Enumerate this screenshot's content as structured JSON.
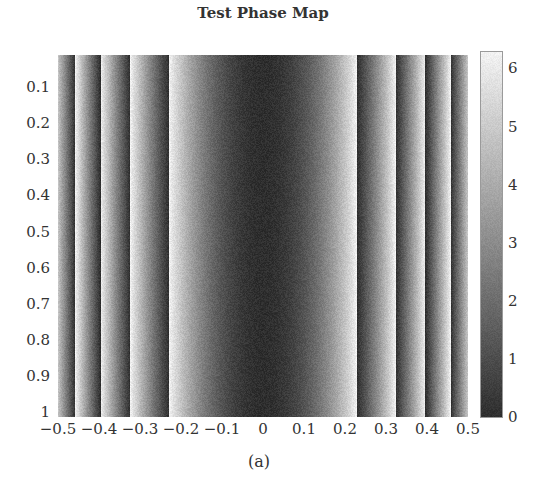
{
  "chart_data": {
    "type": "heatmap",
    "title": "Test Phase Map",
    "caption": "(a)",
    "xlabel": "",
    "ylabel": "",
    "xlim": [
      -0.5,
      0.5
    ],
    "ylim": [
      0.01,
      1
    ],
    "x_ticks": [
      "-0.5",
      "-0.4",
      "-0.3",
      "-0.2",
      "-0.1",
      "0",
      "0.1",
      "0.2",
      "0.3",
      "0.4",
      "0.5"
    ],
    "y_ticks": [
      "0.1",
      "0.2",
      "0.3",
      "0.4",
      "0.5",
      "0.6",
      "0.7",
      "0.8",
      "0.9",
      "1"
    ],
    "colorbar": {
      "range": [
        0,
        6.283
      ],
      "ticks": [
        "0",
        "1",
        "2",
        "3",
        "4",
        "5",
        "6"
      ],
      "colormap": "gray",
      "low_color": "#2e2e2e",
      "high_color": "#f2f2f2"
    },
    "phase_coefficient_k": 120,
    "wrap_boundaries_x": [
      -0.458,
      -0.397,
      -0.324,
      -0.229,
      0.229,
      0.324,
      0.397,
      0.458
    ],
    "noise": true
  },
  "labels": {
    "title": "Test Phase Map",
    "caption": "(a)"
  }
}
